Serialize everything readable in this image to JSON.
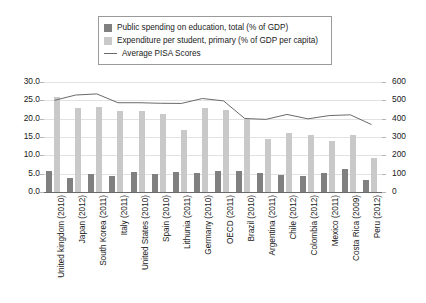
{
  "chart_data": {
    "type": "bar",
    "title": "",
    "xlabel": "",
    "ylabel": "",
    "ylim": [
      0,
      30
    ],
    "y2lim": [
      0,
      600
    ],
    "grid": true,
    "legend_position": "top-center",
    "categories": [
      "United kingdom (2010)",
      "Japan (2012)",
      "South Korea (2011)",
      "Italy (2011)",
      "United States (2010)",
      "Spain (2010)",
      "Lithunia (2011)",
      "Germany (2010)",
      "OECD (2011)",
      "Brazil (2010)",
      "Argentina (2011)",
      "Chile (2012)",
      "Colombia (2012)",
      "Mexico (2011)",
      "Costa Rica (2009)",
      "Peru (2012)"
    ],
    "yticks_left": [
      "0.0",
      "5.0",
      "10.0",
      "15.0",
      "20.0",
      "25.0",
      "30.0"
    ],
    "yticks_right": [
      "0",
      "100",
      "200",
      "300",
      "400",
      "500",
      "600"
    ],
    "series": [
      {
        "name": "Public spending on education, total (% of GDP)",
        "type": "bar",
        "axis": "left",
        "color": "#808080",
        "values": [
          5.6,
          3.8,
          5.0,
          4.3,
          5.4,
          5.0,
          5.4,
          5.1,
          5.6,
          5.7,
          5.1,
          4.6,
          4.4,
          5.2,
          6.3,
          3.3
        ]
      },
      {
        "name": "Expenditure per student, primary (% of GDP per capita)",
        "type": "bar",
        "axis": "left",
        "color": "#c9c9c9",
        "values": [
          25.8,
          23.0,
          23.3,
          22.2,
          22.1,
          21.4,
          17.0,
          22.9,
          22.3,
          19.9,
          14.5,
          16.2,
          15.5,
          14.0,
          15.6,
          9.4
        ]
      },
      {
        "name": "Average PISA Scores",
        "type": "line",
        "axis": "right",
        "color": "#6a6a6a",
        "values": [
          500,
          529,
          535,
          487,
          487,
          484,
          483,
          510,
          497,
          401,
          396,
          423,
          399,
          417,
          421,
          368
        ]
      }
    ]
  },
  "legend": {
    "items": [
      {
        "label": "Public spending on education, total (% of GDP)",
        "marker": "swatch-dark"
      },
      {
        "label": "Expenditure per student, primary (% of GDP per capita)",
        "marker": "swatch-light"
      },
      {
        "label": "Average PISA Scores",
        "marker": "line-marker"
      }
    ]
  },
  "colors": {
    "bar_dark": "#808080",
    "bar_light": "#c9c9c9",
    "line": "#6a6a6a",
    "grid": "#e2e2e2",
    "axis": "#6a6a6a",
    "text": "#1a1a1a",
    "background": "#ffffff"
  }
}
